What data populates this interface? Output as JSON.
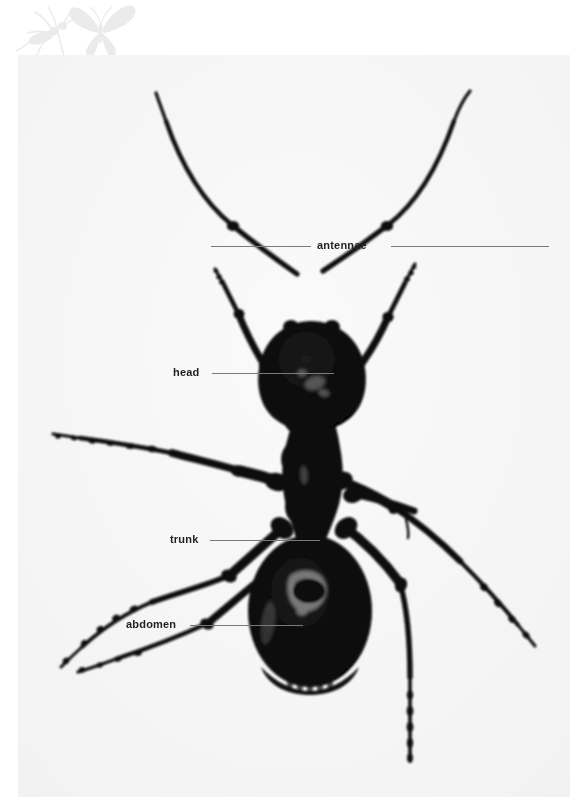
{
  "page": {
    "background_color": "#ffffff",
    "panel_color": "#f7f7f7",
    "width": 587,
    "height": 811
  },
  "watermark": {
    "name": "insect-silhouette-watermark",
    "color": "#ebebeb",
    "shapes": [
      "ant-silhouette",
      "butterfly-silhouette"
    ]
  },
  "specimen": {
    "name": "ant-specimen-photograph",
    "subject": "ant",
    "view": "dorsal",
    "silhouette_color": "#0b0b0b",
    "parts": [
      "antennae",
      "head",
      "trunk",
      "abdomen",
      "legs"
    ]
  },
  "labels": {
    "antennae": "antennae",
    "head": "head",
    "trunk": "trunk",
    "abdomen": "abdomen"
  },
  "style": {
    "label_color": "#231f20",
    "leader_color": "#7a7a7a"
  }
}
